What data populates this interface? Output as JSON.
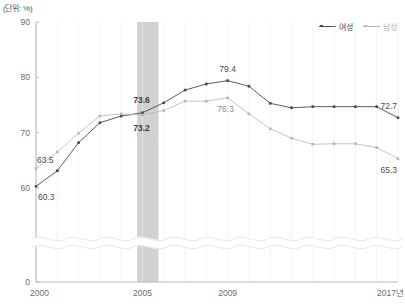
{
  "unit_label": "(단위: %)",
  "legend": {
    "position": "top-right",
    "items": [
      {
        "name": "여성",
        "color": "#4a4a4a",
        "marker": "square-line"
      },
      {
        "name": "남성",
        "color": "#b6b6b6",
        "marker": "square-line"
      }
    ]
  },
  "axis": {
    "y_ticks": [
      "0",
      "60",
      "70",
      "80",
      "90"
    ],
    "y_broken": true,
    "x_ticks": [
      "2000",
      "2005",
      "2009",
      "2017년"
    ]
  },
  "highlight_band": {
    "label": "2005",
    "color": "#c9c9c9"
  },
  "chart_data": {
    "type": "line",
    "title": "",
    "xlabel": "",
    "ylabel": "",
    "ylim": [
      58,
      90
    ],
    "y_axis_break": true,
    "grid": true,
    "x": [
      2000,
      2001,
      2002,
      2003,
      2004,
      2005,
      2006,
      2007,
      2008,
      2009,
      2010,
      2011,
      2012,
      2013,
      2014,
      2015,
      2016,
      2017
    ],
    "series": [
      {
        "name": "여성",
        "color": "#4a4a4a",
        "values": [
          60.3,
          63.1,
          68.2,
          71.8,
          73.0,
          73.6,
          75.4,
          77.7,
          78.8,
          79.4,
          78.4,
          75.3,
          74.5,
          74.7,
          74.7,
          74.7,
          74.7,
          72.7
        ],
        "labels": [
          {
            "x": 2000,
            "value": 60.3,
            "text": "60.3"
          },
          {
            "x": 2005,
            "value": 73.6,
            "text": "73.6"
          },
          {
            "x": 2009,
            "value": 79.4,
            "text": "79.4"
          },
          {
            "x": 2017,
            "value": 72.7,
            "text": "72.7"
          }
        ]
      },
      {
        "name": "남성",
        "color": "#b6b6b6",
        "values": [
          63.5,
          66.5,
          69.9,
          73.0,
          73.4,
          73.2,
          74.0,
          75.7,
          75.7,
          76.3,
          73.4,
          70.7,
          69.0,
          67.9,
          68.0,
          68.0,
          67.3,
          65.3
        ],
        "labels": [
          {
            "x": 2000,
            "value": 63.5,
            "text": "63.5"
          },
          {
            "x": 2005,
            "value": 73.2,
            "text": "73.2"
          },
          {
            "x": 2009,
            "value": 76.3,
            "text": "76.3"
          },
          {
            "x": 2017,
            "value": 65.3,
            "text": "65.3"
          }
        ]
      }
    ]
  }
}
